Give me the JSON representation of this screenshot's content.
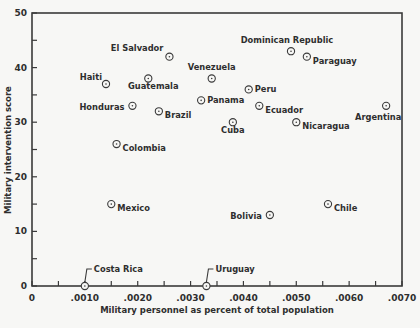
{
  "chart_data": {
    "type": "scatter",
    "title": "",
    "xlabel": "Military personnel as percent of total population",
    "ylabel": "Military intervention score",
    "xlim": [
      0,
      0.007
    ],
    "ylim": [
      0,
      50
    ],
    "grid": false,
    "legend": null,
    "x_ticks": [
      0,
      0.0005,
      0.001,
      0.0015,
      0.002,
      0.0025,
      0.003,
      0.0035,
      0.004,
      0.0045,
      0.005,
      0.0055,
      0.006,
      0.0065,
      0.007
    ],
    "x_tick_labels": [
      {
        "value": 0,
        "label": "0"
      },
      {
        "value": 0.001,
        "label": ".0010"
      },
      {
        "value": 0.002,
        "label": ".0020"
      },
      {
        "value": 0.003,
        "label": ".0030"
      },
      {
        "value": 0.004,
        "label": ".0040"
      },
      {
        "value": 0.005,
        "label": ".0050"
      },
      {
        "value": 0.006,
        "label": ".0060"
      },
      {
        "value": 0.007,
        "label": ".0070"
      }
    ],
    "y_ticks": [
      0,
      5,
      10,
      15,
      20,
      25,
      30,
      35,
      40,
      45,
      50
    ],
    "y_tick_labels": [
      {
        "value": 0,
        "label": "0"
      },
      {
        "value": 10,
        "label": "10"
      },
      {
        "value": 20,
        "label": "20"
      },
      {
        "value": 30,
        "label": "30"
      },
      {
        "value": 40,
        "label": "40"
      },
      {
        "value": 50,
        "label": "50"
      }
    ],
    "points": [
      {
        "label": "El Salvador",
        "x": 0.0026,
        "y": 42,
        "label_pos": "left-up"
      },
      {
        "label": "Haiti",
        "x": 0.0014,
        "y": 37,
        "label_pos": "left-up"
      },
      {
        "label": "Guatemala",
        "x": 0.0022,
        "y": 38,
        "label_pos": "below"
      },
      {
        "label": "Honduras",
        "x": 0.0019,
        "y": 33,
        "label_pos": "left-down"
      },
      {
        "label": "Brazil",
        "x": 0.0024,
        "y": 32,
        "label_pos": "right-down"
      },
      {
        "label": "Colombia",
        "x": 0.0016,
        "y": 26,
        "label_pos": "right-down"
      },
      {
        "label": "Mexico",
        "x": 0.0015,
        "y": 15,
        "label_pos": "right-down"
      },
      {
        "label": "Costa Rica",
        "x": 0.001,
        "y": 0,
        "label_pos": "callout"
      },
      {
        "label": "Uruguay",
        "x": 0.0033,
        "y": 0,
        "label_pos": "callout"
      },
      {
        "label": "Dominican Republic",
        "x": 0.0049,
        "y": 43,
        "label_pos": "above"
      },
      {
        "label": "Paraguay",
        "x": 0.0052,
        "y": 42,
        "label_pos": "right-down"
      },
      {
        "label": "Venezuela",
        "x": 0.0034,
        "y": 38,
        "label_pos": "above"
      },
      {
        "label": "Peru",
        "x": 0.0041,
        "y": 36,
        "label_pos": "right"
      },
      {
        "label": "Panama",
        "x": 0.0032,
        "y": 34,
        "label_pos": "right"
      },
      {
        "label": "Ecuador",
        "x": 0.0043,
        "y": 33,
        "label_pos": "right-down"
      },
      {
        "label": "Cuba",
        "x": 0.0038,
        "y": 30,
        "label_pos": "below"
      },
      {
        "label": "Nicaragua",
        "x": 0.005,
        "y": 30,
        "label_pos": "right-down"
      },
      {
        "label": "Argentina",
        "x": 0.0067,
        "y": 33,
        "label_pos": "below-left"
      },
      {
        "label": "Bolivia",
        "x": 0.0045,
        "y": 13,
        "label_pos": "left-down"
      },
      {
        "label": "Chile",
        "x": 0.0056,
        "y": 15,
        "label_pos": "right-down"
      }
    ]
  },
  "style": {
    "axis_color": "#3a3a3a",
    "marker_color": "#3a3a3a",
    "background": "#f7f7f5"
  }
}
